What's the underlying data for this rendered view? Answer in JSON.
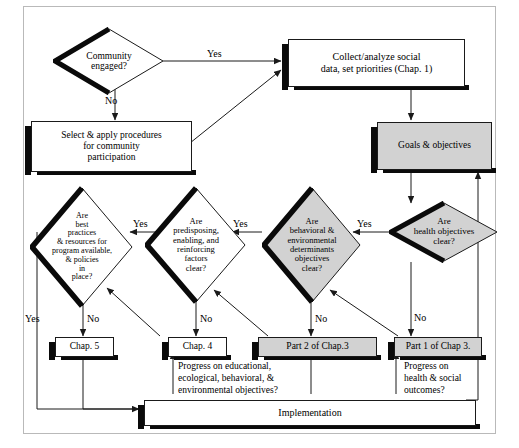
{
  "diagram": {
    "colors": {
      "shaded_fill": "#d2d2d2",
      "plain_fill": "#ffffff",
      "stroke": "#1a1a1a",
      "shadow": "#0a0a0a",
      "frame": "#b9b9b9"
    },
    "nodes": {
      "community_engaged": "Community\nengaged?",
      "collect_analyze": "Collect/analyze social\ndata, set priorities (Chap. 1)",
      "select_apply": "Select & apply procedures\nfor community\nparticipation",
      "goals_objectives": "Goals & objectives",
      "health_objectives": "Are\nhealth objectives\nclear?",
      "behavioral_env": "Are\nbehavioral &\nenvironmental\ndeterminants\nobjectives\nclear?",
      "predisposing": "Are\npredisposing,\nenabling, and\nreinforcing\nfactors\nclear?",
      "best_practices": "Are\nbest\npractices\n& resources for\nprogram available,\n& policies\nin\nplace?",
      "chap5": "Chap. 5",
      "chap4": "Chap. 4",
      "part2_chap3": "Part 2 of Chap.3",
      "part1_chap3": "Part 1 of Chap 3.",
      "implementation": "Implementation"
    },
    "edge_labels": {
      "yes_community": "Yes",
      "no_community": "No",
      "yes_health": "Yes",
      "no_health": "No",
      "yes_behavioral": "Yes",
      "no_behavioral": "No",
      "yes_predisposing": "Yes",
      "no_predisposing": "No",
      "yes_best": "Yes",
      "no_best": "No"
    },
    "annotations": {
      "progress_edu": "Progress on educational,\necological, behavioral, &\nenvironmental objectives?",
      "progress_health": "Progress on\nhealth & social\noutcomes?"
    }
  }
}
